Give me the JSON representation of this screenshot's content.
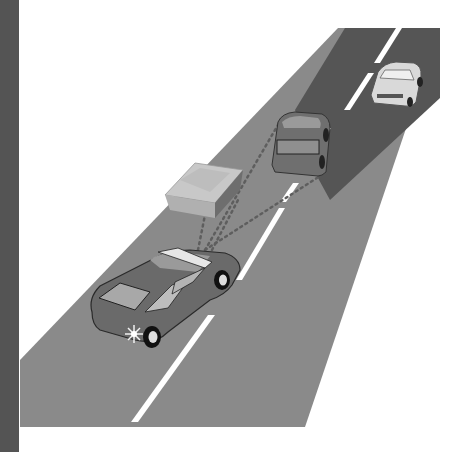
{
  "figure": {
    "colors": {
      "background": "#ffffff",
      "left_bar": "#545454",
      "road": "#8a8a8a",
      "sensor_zone": "#555555",
      "lane_marking": "#ffffff",
      "sensor_ray": "#6a6a6a"
    },
    "elements": {
      "ego_vehicle": "dark gray sedan with headlight flare",
      "obstacle": "box-shaped object on roadside",
      "lead_vehicle": "gray sedan ahead in same lane",
      "far_vehicle": "white sedan in adjacent lane"
    }
  }
}
